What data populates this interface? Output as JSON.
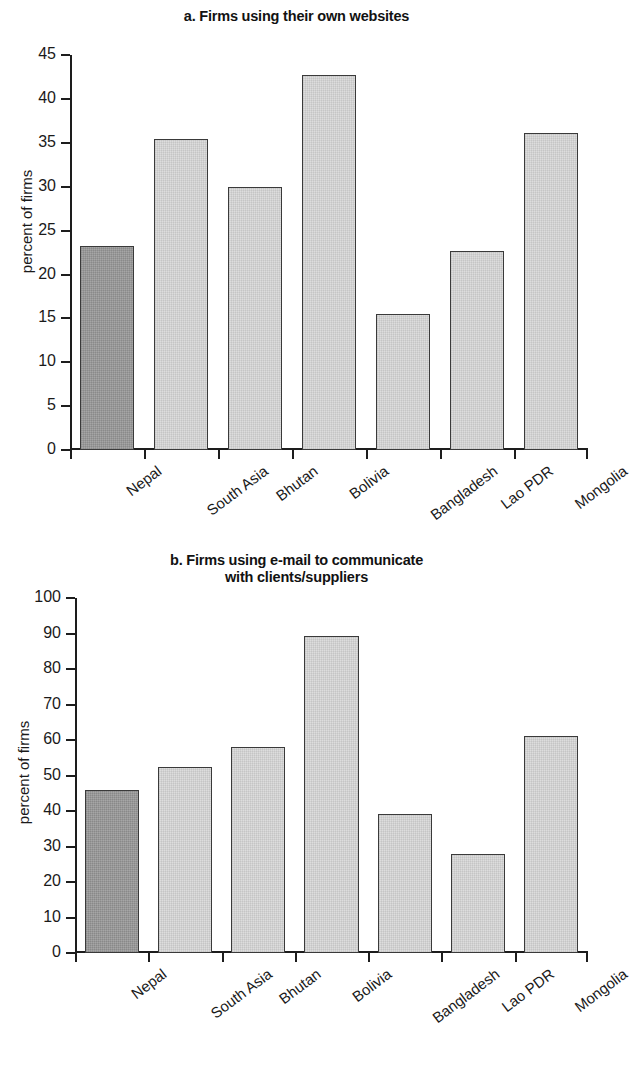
{
  "figure": {
    "ylabel": "percent of firms",
    "categories": [
      "Nepal",
      "South Asia",
      "Bhutan",
      "Bolivia",
      "Bangladesh",
      "Lao PDR",
      "Mongolia"
    ],
    "colors": {
      "highlight_bar": "#9b9b9b",
      "bar": "#d9d9d9",
      "bar_border": "#3a3a3a",
      "axis": "#1d1d1d",
      "text": "#1a1a1a"
    }
  },
  "panel_a": {
    "title": "a. Firms using their own websites",
    "ylabel": "percent of firms",
    "yticks": [
      "0",
      "5",
      "10",
      "15",
      "20",
      "25",
      "30",
      "35",
      "40",
      "45"
    ]
  },
  "panel_b": {
    "title_line1": "b. Firms using e-mail to communicate",
    "title_line2": "with clients/suppliers",
    "ylabel": "percent of firms",
    "yticks": [
      "0",
      "10",
      "20",
      "30",
      "40",
      "50",
      "60",
      "70",
      "80",
      "90",
      "100"
    ]
  },
  "chart_data": [
    {
      "type": "bar",
      "id": "panel_a",
      "title": "a. Firms using their own websites",
      "xlabel": "",
      "ylabel": "percent of firms",
      "categories": [
        "Nepal",
        "South Asia",
        "Bhutan",
        "Bolivia",
        "Bangladesh",
        "Lao PDR",
        "Mongolia"
      ],
      "values": [
        23.2,
        35.5,
        30.0,
        42.7,
        15.5,
        22.7,
        36.1
      ],
      "highlighted_category": "Nepal",
      "ylim": [
        0,
        45
      ],
      "ytick_step": 5,
      "yticks": [
        0,
        5,
        10,
        15,
        20,
        25,
        30,
        35,
        40,
        45
      ],
      "grid": false,
      "legend": null
    },
    {
      "type": "bar",
      "id": "panel_b",
      "title": "b. Firms using e-mail to communicate with clients/suppliers",
      "xlabel": "",
      "ylabel": "percent of firms",
      "categories": [
        "Nepal",
        "South Asia",
        "Bhutan",
        "Bolivia",
        "Bangladesh",
        "Lao PDR",
        "Mongolia"
      ],
      "values": [
        46.0,
        52.6,
        58.0,
        89.5,
        39.3,
        28.0,
        61.3
      ],
      "highlighted_category": "Nepal",
      "ylim": [
        0,
        100
      ],
      "ytick_step": 10,
      "yticks": [
        0,
        10,
        20,
        30,
        40,
        50,
        60,
        70,
        80,
        90,
        100
      ],
      "grid": false,
      "legend": null
    }
  ]
}
